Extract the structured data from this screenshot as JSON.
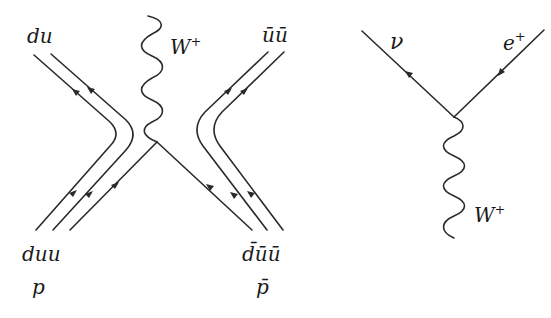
{
  "diagrams": [
    {
      "name": "proton-antiproton-annihilation",
      "labels": {
        "top_left": "du",
        "top_right": "ūū",
        "bottom_left_quarks": "duu",
        "bottom_left_particle": "p",
        "bottom_right_quarks": "d̄ūū",
        "bottom_right_particle": "p̄",
        "boson": "W",
        "boson_charge": "+"
      }
    },
    {
      "name": "w-decay-vertex",
      "labels": {
        "outgoing_left": "ν",
        "incoming_right": "e",
        "incoming_right_charge": "+",
        "boson": "W",
        "boson_charge": "+"
      }
    }
  ],
  "colors": {
    "line": "#2a2a2a",
    "text": "#1a1a1a",
    "background": "#ffffff"
  }
}
